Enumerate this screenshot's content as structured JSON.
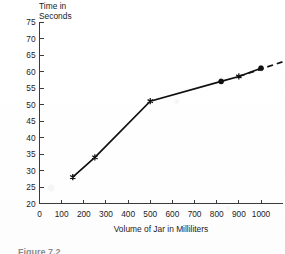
{
  "figure": {
    "caption": "Figure 7.2",
    "y_axis_title_line1": "Time in",
    "y_axis_title_line2": "Seconds"
  },
  "chart_data": {
    "type": "line",
    "title": "",
    "subtitle": "",
    "xlabel": "Volume of Jar in Milliliters",
    "ylabel": "Time in Seconds",
    "xlim": [
      0,
      1100
    ],
    "ylim": [
      20,
      75
    ],
    "grid": false,
    "legend": "none",
    "xticks": [
      0,
      100,
      200,
      300,
      400,
      500,
      600,
      700,
      800,
      900,
      1000
    ],
    "yticks": [
      20,
      25,
      30,
      35,
      40,
      45,
      50,
      55,
      60,
      65,
      70,
      75
    ],
    "xtick_labels": [
      "0",
      "100",
      "200",
      "300",
      "400",
      "500",
      "600",
      "700",
      "800",
      "900",
      "1000"
    ],
    "ytick_labels": [
      "20",
      "25",
      "30",
      "35",
      "40",
      "45",
      "50",
      "55",
      "60",
      "65",
      "70",
      "75"
    ],
    "x": [
      150,
      250,
      500,
      820,
      900,
      1000
    ],
    "y": [
      28,
      34,
      51,
      57,
      58.5,
      61
    ],
    "markers": [
      "star",
      "star",
      "star",
      "dot",
      "star",
      "dot"
    ],
    "series": [
      {
        "name": "Time to fill jar",
        "style": "solid",
        "x": [
          150,
          250,
          500,
          820,
          900,
          1000
        ],
        "values": [
          28,
          34,
          51,
          57,
          58.5,
          61
        ]
      },
      {
        "name": "Extrapolation",
        "style": "dashed",
        "x": [
          900,
          1100
        ],
        "values": [
          58.5,
          63
        ]
      }
    ],
    "line_color": "#101010",
    "axis_color": "#3b3b3b",
    "annotations": []
  }
}
